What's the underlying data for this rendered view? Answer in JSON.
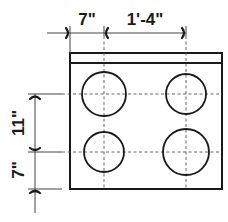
{
  "diagram": {
    "horizontal_dimensions": [
      {
        "label": "7\"",
        "from": "cooktop-left-edge",
        "to": "left-burner-centerline"
      },
      {
        "label": "1'-4\"",
        "from": "left-burner-centerline",
        "to": "right-burner-centerline"
      }
    ],
    "vertical_dimensions": [
      {
        "label": "11\"",
        "from": "rear-burner-centerline",
        "to": "front-burner-centerline"
      },
      {
        "label": "7\"",
        "from": "front-burner-centerline",
        "to": "cooktop-front-edge"
      }
    ],
    "burners": [
      {
        "position": "rear-left",
        "size": "large"
      },
      {
        "position": "rear-right",
        "size": "medium"
      },
      {
        "position": "front-left",
        "size": "medium"
      },
      {
        "position": "front-right",
        "size": "large"
      }
    ],
    "colors": {
      "line": "#1a1a1a",
      "centerline": "#555555",
      "background": "#ffffff"
    }
  }
}
